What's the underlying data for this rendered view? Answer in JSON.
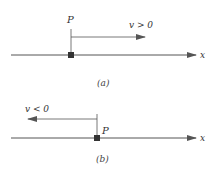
{
  "colors": {
    "line": "#555555",
    "point": "#333333",
    "text": "#333333",
    "background": "#ffffff"
  },
  "panels": [
    {
      "id": "a",
      "caption": "(a)",
      "axis_label": "x",
      "point_label": "P",
      "velocity_label": "v > 0",
      "velocity_direction": "right"
    },
    {
      "id": "b",
      "caption": "(b)",
      "axis_label": "x",
      "point_label": "P",
      "velocity_label": "v < 0",
      "velocity_direction": "left"
    }
  ]
}
